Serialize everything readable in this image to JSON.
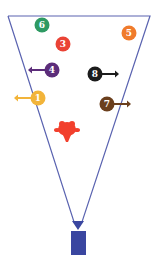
{
  "diagram": {
    "type": "camera-field-of-view",
    "colors": {
      "fov_line": "#5a63b0",
      "camera": "#3a46a0",
      "figure": "#f2402d"
    },
    "objects": [
      {
        "id": "6",
        "label": "6",
        "color": "#2e9a63",
        "cx": 42,
        "cy": 25,
        "arrow": "none"
      },
      {
        "id": "3",
        "label": "3",
        "color": "#ea4335",
        "cx": 63,
        "cy": 44,
        "arrow": "none"
      },
      {
        "id": "5",
        "label": "5",
        "color": "#f07b2c",
        "cx": 129,
        "cy": 33,
        "arrow": "none"
      },
      {
        "id": "4",
        "label": "4",
        "color": "#5c2d7a",
        "cx": 52,
        "cy": 70,
        "arrow": "left"
      },
      {
        "id": "8",
        "label": "8",
        "color": "#1c1c1c",
        "cx": 95,
        "cy": 74,
        "arrow": "right"
      },
      {
        "id": "1",
        "label": "1",
        "color": "#f2b43a",
        "cx": 38,
        "cy": 98,
        "arrow": "left"
      },
      {
        "id": "7",
        "label": "7",
        "color": "#6b3f1d",
        "cx": 107,
        "cy": 104,
        "arrow": "right"
      }
    ],
    "figure": {
      "name": "red-person",
      "cx": 67,
      "cy": 131
    },
    "camera": {
      "name": "camera",
      "x": 78,
      "y": 222
    }
  }
}
